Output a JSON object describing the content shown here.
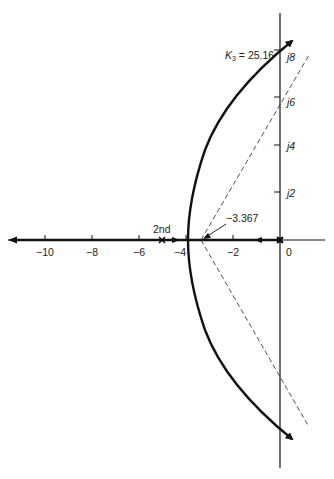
{
  "diagram": {
    "type": "root-locus",
    "colors": {
      "ink": "#111111",
      "background": "#ffffff"
    },
    "real_axis": {
      "tick_labels": [
        "−10",
        "−8",
        "−6",
        "−4",
        "−2",
        "0"
      ],
      "tick_values": [
        -10,
        -8,
        -6,
        -4,
        -2,
        0
      ]
    },
    "imag_axis": {
      "tick_labels": [
        "j8",
        "j6",
        "j4",
        "j2"
      ],
      "tick_values": [
        8,
        6,
        4,
        2
      ]
    },
    "annotations": {
      "gain_label_k": "K",
      "gain_label_sub": "3",
      "gain_label_value": " = 25.16",
      "centroid_label": "−3.367",
      "second_pole_label": "2nd"
    },
    "asymptote_centroid": -3.367,
    "imag_crossing_gain": 25.16,
    "poles": [
      0,
      -5
    ],
    "breakaway": -3.9
  }
}
